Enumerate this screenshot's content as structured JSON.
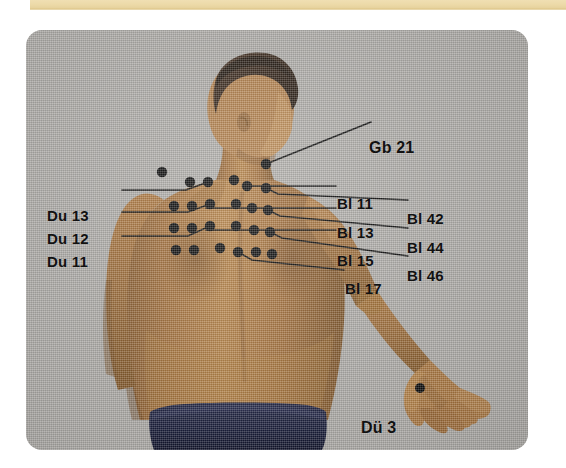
{
  "page": {
    "background_color": "#ffffff"
  },
  "top_band": {
    "name": "decorative-beige-band",
    "color": "#ecd9a7"
  },
  "photo_card": {
    "backdrop_color": "#b0aeaa",
    "corner_radius_px": 16,
    "subject": "male-back-view",
    "skin_color": "#a9763f",
    "hair_color": "#3a2a1c",
    "trunks_color": "#1b1f3d"
  },
  "labels": [
    {
      "id": "gb-21",
      "text": "Gb 21",
      "x": 369,
      "y": 118,
      "side": "right"
    },
    {
      "id": "bl-11",
      "text": "Bl 11",
      "x": 336,
      "y": 174,
      "side": "right"
    },
    {
      "id": "bl-42",
      "text": "Bl 42",
      "x": 406,
      "y": 190,
      "side": "right"
    },
    {
      "id": "bl-13",
      "text": "Bl 13",
      "x": 336,
      "y": 203,
      "side": "right"
    },
    {
      "id": "bl-44",
      "text": "Bl 44",
      "x": 406,
      "y": 219,
      "side": "right"
    },
    {
      "id": "bl-15",
      "text": "Bl 15",
      "x": 336,
      "y": 231,
      "side": "right"
    },
    {
      "id": "bl-46",
      "text": "Bl 46",
      "x": 406,
      "y": 247,
      "side": "right"
    },
    {
      "id": "bl-17",
      "text": "Bl 17",
      "x": 344,
      "y": 259,
      "side": "right"
    },
    {
      "id": "du-13",
      "text": "Du 13",
      "x": 47,
      "y": 187,
      "side": "left"
    },
    {
      "id": "du-12",
      "text": "Du 12",
      "x": 47,
      "y": 211,
      "side": "left"
    },
    {
      "id": "du-11",
      "text": "Du 11",
      "x": 47,
      "y": 234,
      "side": "left"
    },
    {
      "id": "du-3",
      "text": "Dü 3",
      "x": 361,
      "y": 399,
      "side": "right"
    }
  ],
  "points": {
    "description": "Black acupuncture point markers on the back, arranged in rows flanking the spine, plus shoulder and hand points.",
    "shoulder": [
      {
        "id": "gb-21-left",
        "x": 162,
        "y": 167
      },
      {
        "id": "gb-21-right",
        "x": 264,
        "y": 160
      }
    ],
    "hand": [
      {
        "id": "du-3-point",
        "x": 418,
        "y": 387
      }
    ],
    "rows": [
      {
        "row": "bl-11",
        "y": 181,
        "xs": [
          188,
          203,
          231,
          244
        ]
      },
      {
        "row": "bl-13",
        "y": 203,
        "xs": [
          174,
          190,
          206,
          230,
          244,
          266
        ]
      },
      {
        "row": "bl-15",
        "y": 224,
        "xs": [
          174,
          190,
          206,
          230,
          244,
          266
        ]
      },
      {
        "row": "bl-17",
        "y": 244,
        "xs": [
          176,
          192,
          232,
          246,
          268
        ]
      }
    ]
  },
  "leader_lines": [
    {
      "id": "gb-21-leader",
      "from": [
        264,
        160
      ],
      "to": [
        363,
        117
      ]
    },
    {
      "id": "bl-11-leader",
      "from": [
        247,
        181
      ],
      "to": [
        332,
        181
      ]
    },
    {
      "id": "bl-42-leader",
      "from": [
        268,
        188
      ],
      "to": [
        402,
        195
      ]
    },
    {
      "id": "bl-13-leader",
      "from": [
        248,
        207
      ],
      "to": [
        332,
        207
      ]
    },
    {
      "id": "bl-44-leader",
      "from": [
        270,
        215
      ],
      "to": [
        402,
        224
      ]
    },
    {
      "id": "bl-15-leader",
      "from": [
        250,
        232
      ],
      "to": [
        332,
        232
      ]
    },
    {
      "id": "bl-46-leader",
      "from": [
        272,
        243
      ],
      "to": [
        402,
        252
      ]
    },
    {
      "id": "bl-17-leader",
      "from": [
        236,
        250
      ],
      "to": [
        340,
        264
      ]
    },
    {
      "id": "du-13-leader",
      "from": [
        118,
        190
      ],
      "to": [
        206,
        181
      ]
    },
    {
      "id": "du-12-leader",
      "from": [
        118,
        214
      ],
      "to": [
        208,
        203
      ]
    },
    {
      "id": "du-11-leader",
      "from": [
        118,
        237
      ],
      "to": [
        208,
        224
      ]
    }
  ]
}
